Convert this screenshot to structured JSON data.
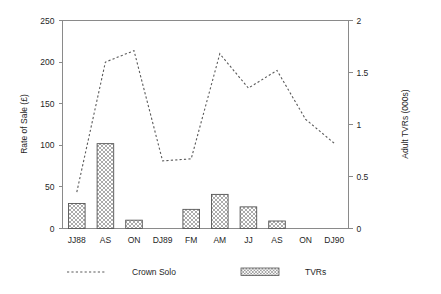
{
  "chart_data": {
    "type": "bar",
    "title": "",
    "subtitle": "",
    "categories": [
      "JJ88",
      "AS",
      "ON",
      "DJ89",
      "FM",
      "AM",
      "JJ",
      "AS",
      "ON",
      "DJ90"
    ],
    "xlabel": "",
    "ylabel": "Rate of Sale  (£)",
    "ylabel_secondary": "Adult TVRs (000s)",
    "ylim": [
      0,
      250
    ],
    "ylim_secondary": [
      0,
      2
    ],
    "yticks": [
      "0",
      "50",
      "100",
      "150",
      "200",
      "250"
    ],
    "ytick_values": [
      0,
      50,
      100,
      150,
      200,
      250
    ],
    "yticks_secondary": [
      "0",
      "0.5",
      "1",
      "1.5",
      "2"
    ],
    "ytick_values_secondary": [
      0,
      0.5,
      1,
      1.5,
      2
    ],
    "grid": false,
    "legend_position": "bottom",
    "series": [
      {
        "name": "Crown Solo",
        "type": "line",
        "axis": "right",
        "style": "dashed",
        "color": "#5a5a5a",
        "values": [
          0.35,
          1.6,
          1.71,
          0.65,
          0.67,
          1.68,
          1.35,
          1.52,
          1.05,
          0.82
        ]
      },
      {
        "name": "TVRs",
        "type": "bar",
        "axis": "left",
        "style": "crosshatch",
        "color": "#555555",
        "values": [
          30,
          102,
          10,
          0,
          23,
          41,
          26,
          9,
          0,
          0
        ]
      }
    ]
  },
  "legend": {
    "items": [
      {
        "label": "Crown Solo",
        "marker": "dashed-line-swatch"
      },
      {
        "label": "TVRs",
        "marker": "crosshatch-swatch"
      }
    ]
  },
  "axes": {
    "left_title": "Rate of Sale  (£)",
    "right_title": "Adult TVRs (000s)"
  }
}
